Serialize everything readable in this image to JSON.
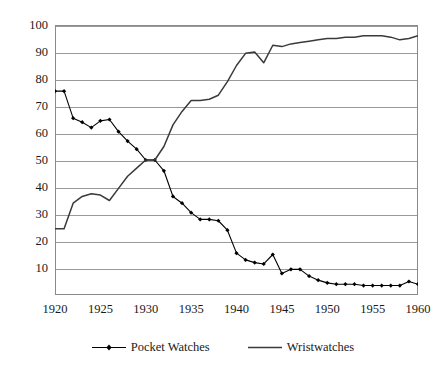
{
  "chart_data": {
    "type": "line",
    "title": "",
    "subtitle": "",
    "xlabel": "",
    "ylabel": "",
    "xlim": [
      1920,
      1960
    ],
    "ylim": [
      0,
      100
    ],
    "yticks": [
      10,
      20,
      30,
      40,
      50,
      60,
      70,
      80,
      90,
      100
    ],
    "xticks": [
      1920,
      1925,
      1930,
      1935,
      1940,
      1945,
      1950,
      1955,
      1960
    ],
    "grid": "horizontal",
    "legend_position": "bottom",
    "x": [
      1920,
      1921,
      1922,
      1923,
      1924,
      1925,
      1926,
      1927,
      1928,
      1929,
      1930,
      1931,
      1932,
      1933,
      1934,
      1935,
      1936,
      1937,
      1938,
      1939,
      1940,
      1941,
      1942,
      1943,
      1944,
      1945,
      1946,
      1947,
      1948,
      1949,
      1950,
      1951,
      1952,
      1953,
      1954,
      1955,
      1956,
      1957,
      1958,
      1959,
      1960
    ],
    "series": [
      {
        "name": "Pocket Watches",
        "marker": "filled-diamond",
        "color": "#000000",
        "values": [
          75.5,
          75.5,
          65.5,
          64.0,
          62.0,
          64.5,
          65.0,
          60.5,
          57.0,
          54.0,
          50.0,
          50.0,
          46.0,
          36.5,
          34.0,
          30.5,
          28.0,
          28.0,
          27.5,
          24.0,
          15.5,
          13.0,
          12.0,
          11.5,
          15.0,
          8.0,
          9.5,
          9.5,
          7.0,
          5.5,
          4.5,
          4.0,
          4.0,
          4.0,
          3.5,
          3.5,
          3.5,
          3.5,
          3.5,
          5.0,
          4.0
        ]
      },
      {
        "name": "Wristwatches",
        "marker": "none",
        "color": "#3a3a3a",
        "values": [
          24.5,
          24.5,
          34.0,
          36.5,
          37.5,
          37.0,
          35.0,
          39.5,
          44.0,
          47.0,
          50.0,
          50.0,
          55.0,
          63.0,
          68.0,
          72.0,
          72.0,
          72.5,
          74.0,
          79.0,
          85.0,
          89.5,
          90.0,
          86.0,
          92.5,
          92.0,
          93.0,
          93.5,
          94.0,
          94.5,
          95.0,
          95.0,
          95.5,
          95.5,
          96.0,
          96.0,
          96.0,
          95.5,
          94.5,
          95.0,
          96.0
        ]
      }
    ]
  },
  "legend": {
    "entries": [
      {
        "label": "Pocket Watches"
      },
      {
        "label": "Wristwatches"
      }
    ]
  }
}
